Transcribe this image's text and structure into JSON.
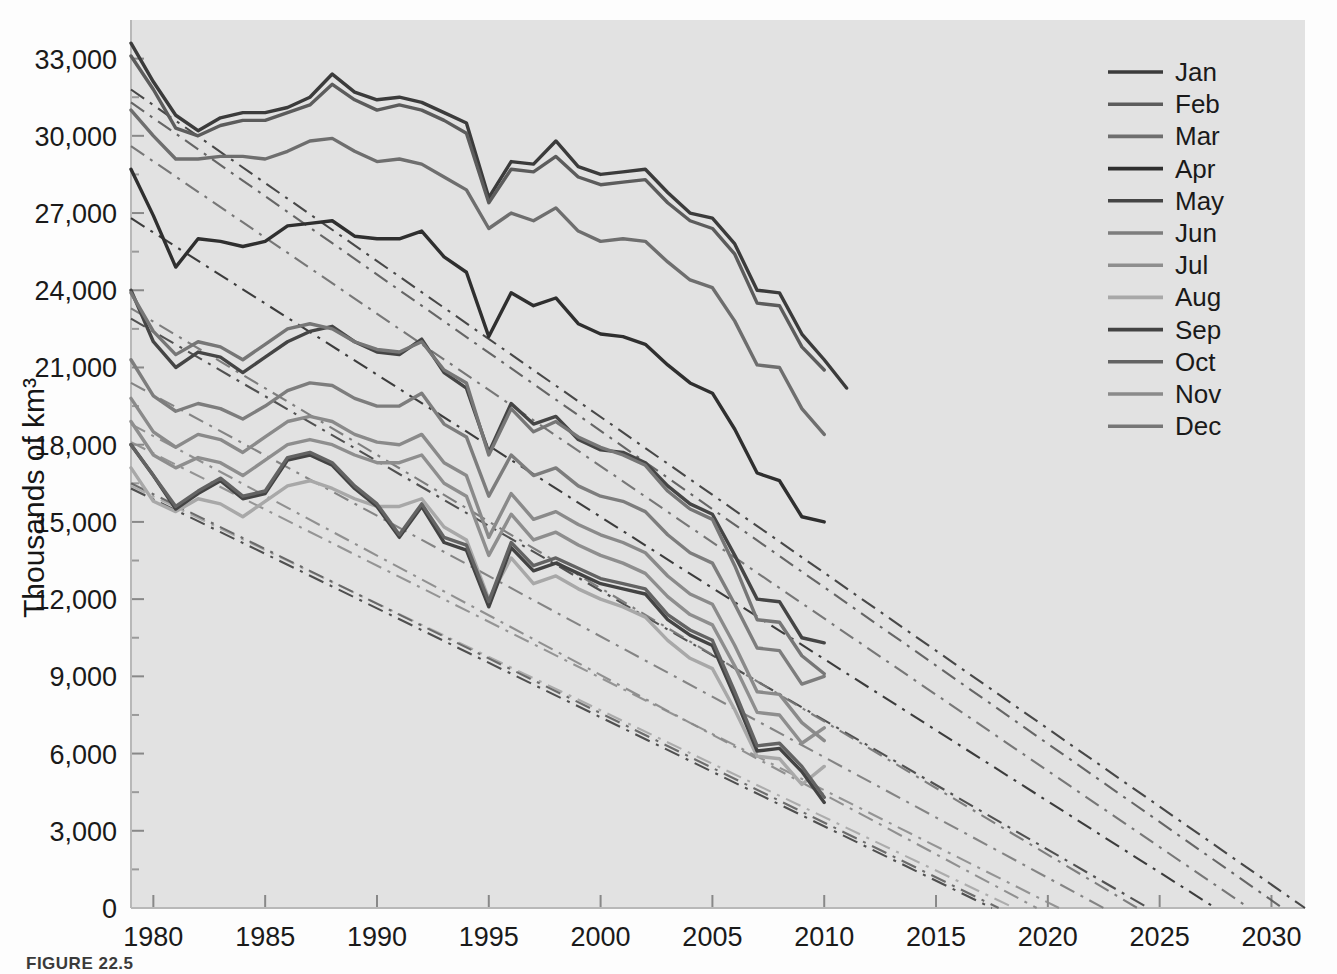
{
  "figure": {
    "caption": "FIGURE 22.5",
    "background": "#fdfdfd",
    "plot_background": "#e2e2e2"
  },
  "axis": {
    "y_title": "Thousands of km³",
    "y_ticks": [
      "0",
      "3,000",
      "6,000",
      "9,000",
      "12,000",
      "15,000",
      "18,000",
      "21,000",
      "24,000",
      "27,000",
      "30,000",
      "33,000"
    ],
    "x_ticks": [
      "1980",
      "1985",
      "1990",
      "1995",
      "2000",
      "2005",
      "2010",
      "2015",
      "2020",
      "2025",
      "2030"
    ]
  },
  "legend": {
    "items": [
      {
        "label": "Jan",
        "color": "#3b3b3b"
      },
      {
        "label": "Feb",
        "color": "#5c5c5c"
      },
      {
        "label": "Mar",
        "color": "#6e6e6e"
      },
      {
        "label": "Apr",
        "color": "#2f2f2f"
      },
      {
        "label": "May",
        "color": "#454545"
      },
      {
        "label": "Jun",
        "color": "#7d7d7d"
      },
      {
        "label": "Jul",
        "color": "#8e8e8e"
      },
      {
        "label": "Aug",
        "color": "#a8a8a8"
      },
      {
        "label": "Sep",
        "color": "#434343"
      },
      {
        "label": "Oct",
        "color": "#636363"
      },
      {
        "label": "Nov",
        "color": "#8a8a8a"
      },
      {
        "label": "Dec",
        "color": "#767676"
      }
    ]
  },
  "chart_data": {
    "type": "line",
    "title": "",
    "xlabel": "",
    "ylabel": "Thousands of km³",
    "xlim": [
      1979,
      2031.5
    ],
    "ylim": [
      0,
      34500
    ],
    "grid": false,
    "legend_position": "top-right",
    "x": [
      1979,
      1980,
      1981,
      1982,
      1983,
      1984,
      1985,
      1986,
      1987,
      1988,
      1989,
      1990,
      1991,
      1992,
      1993,
      1994,
      1995,
      1996,
      1997,
      1998,
      1999,
      2000,
      2001,
      2002,
      2003,
      2004,
      2005,
      2006,
      2007,
      2008,
      2009,
      2010,
      2011
    ],
    "series": [
      {
        "name": "Jan",
        "color": "#3b3b3b",
        "values": [
          33600,
          32100,
          30800,
          30200,
          30700,
          30900,
          30900,
          31100,
          31500,
          32400,
          31700,
          31400,
          31500,
          31300,
          30900,
          30500,
          27600,
          29000,
          28900,
          29800,
          28800,
          28500,
          28600,
          28700,
          27800,
          27000,
          26800,
          25800,
          24000,
          23900,
          22300,
          21300,
          20200
        ],
        "trend": {
          "start_year": 1979,
          "start_value": 31800,
          "end_year": 2031.5,
          "end_value": 0,
          "style": "dashdot"
        }
      },
      {
        "name": "Feb",
        "color": "#5c5c5c",
        "values": [
          33100,
          31800,
          30300,
          30000,
          30400,
          30600,
          30600,
          30900,
          31200,
          32000,
          31400,
          31000,
          31200,
          31000,
          30600,
          30100,
          27400,
          28700,
          28600,
          29200,
          28400,
          28100,
          28200,
          28300,
          27400,
          26700,
          26400,
          25400,
          23500,
          23400,
          21800,
          20900,
          null
        ],
        "trend": {
          "start_year": 1979,
          "start_value": 31300,
          "end_year": 2030.5,
          "end_value": 0,
          "style": "dashdot"
        }
      },
      {
        "name": "Mar",
        "color": "#6e6e6e",
        "values": [
          31000,
          30000,
          29100,
          29100,
          29200,
          29200,
          29100,
          29400,
          29800,
          29900,
          29400,
          29000,
          29100,
          28900,
          28400,
          27900,
          26400,
          27000,
          26700,
          27200,
          26300,
          25900,
          26000,
          25900,
          25100,
          24400,
          24100,
          22800,
          21100,
          21000,
          19400,
          18400,
          null
        ],
        "trend": {
          "start_year": 1979,
          "start_value": 29600,
          "end_year": 2029.0,
          "end_value": 0,
          "style": "dashdot"
        }
      },
      {
        "name": "Apr",
        "color": "#2f2f2f",
        "values": [
          28700,
          26900,
          24900,
          26000,
          25900,
          25700,
          25900,
          26500,
          26600,
          26700,
          26100,
          26000,
          26000,
          26300,
          25300,
          24700,
          22200,
          23900,
          23400,
          23700,
          22700,
          22300,
          22200,
          21900,
          21100,
          20400,
          20000,
          18600,
          16900,
          16600,
          15200,
          15000,
          null
        ],
        "trend": {
          "start_year": 1979,
          "start_value": 26800,
          "end_year": 2027.5,
          "end_value": 0,
          "style": "dashdot"
        }
      },
      {
        "name": "May",
        "color": "#454545",
        "values": [
          24000,
          22000,
          21000,
          21600,
          21400,
          20800,
          21400,
          22000,
          22400,
          22600,
          22000,
          21600,
          21500,
          22100,
          20800,
          20200,
          17700,
          19600,
          18800,
          19100,
          18200,
          17800,
          17700,
          17300,
          16400,
          15700,
          15300,
          13700,
          12000,
          11900,
          10500,
          10300,
          null
        ],
        "trend": {
          "start_year": 1979,
          "start_value": 22900,
          "end_year": 2024.5,
          "end_value": 0,
          "style": "dashdot"
        }
      },
      {
        "name": "Jun",
        "color": "#7d7d7d",
        "values": [
          21300,
          19900,
          19300,
          19600,
          19400,
          19000,
          19500,
          20100,
          20400,
          20300,
          19800,
          19500,
          19500,
          20000,
          18800,
          18300,
          16000,
          17600,
          16800,
          17100,
          16400,
          16000,
          15800,
          15400,
          14500,
          13800,
          13400,
          11800,
          10100,
          10000,
          8700,
          9000,
          null
        ],
        "trend": {
          "start_year": 1979,
          "start_value": 20400,
          "end_year": 2022.5,
          "end_value": 0,
          "style": "dashdot"
        }
      },
      {
        "name": "Jul",
        "color": "#8e8e8e",
        "values": [
          18900,
          17600,
          17100,
          17500,
          17300,
          16800,
          17400,
          18000,
          18200,
          18000,
          17600,
          17300,
          17300,
          17600,
          16500,
          16000,
          13700,
          15300,
          14300,
          14600,
          14100,
          13700,
          13400,
          13000,
          12100,
          11400,
          11000,
          9400,
          7600,
          7500,
          6400,
          7000,
          null
        ],
        "trend": {
          "start_year": 1979,
          "start_value": 18100,
          "end_year": 2020.5,
          "end_value": 0,
          "style": "dashdot"
        }
      },
      {
        "name": "Aug",
        "color": "#a8a8a8",
        "values": [
          17100,
          15800,
          15400,
          15900,
          15700,
          15200,
          15800,
          16400,
          16600,
          16300,
          15900,
          15600,
          15600,
          15900,
          14800,
          14300,
          12000,
          13600,
          12600,
          12900,
          12400,
          12000,
          11700,
          11300,
          10400,
          9700,
          9300,
          7700,
          5900,
          5800,
          4800,
          5500,
          null
        ],
        "trend": {
          "start_year": 1979,
          "start_value": 16400,
          "end_year": 2018.5,
          "end_value": 0,
          "style": "dashdot"
        }
      },
      {
        "name": "Sep",
        "color": "#434343",
        "values": [
          18000,
          16800,
          15500,
          16100,
          16600,
          15900,
          16100,
          17400,
          17600,
          17200,
          16300,
          15600,
          14400,
          15600,
          14200,
          13900,
          11700,
          14000,
          13100,
          13400,
          13000,
          12600,
          12400,
          12200,
          11200,
          10600,
          10200,
          8200,
          6100,
          6200,
          5300,
          4100,
          null
        ],
        "trend": {
          "start_year": 1979,
          "start_value": 16300,
          "end_year": 2017.5,
          "end_value": 0,
          "style": "dashdot"
        }
      },
      {
        "name": "Oct",
        "color": "#636363",
        "values": [
          18000,
          16800,
          15600,
          16200,
          16700,
          16000,
          16200,
          17500,
          17700,
          17300,
          16400,
          15700,
          14500,
          15700,
          14400,
          14100,
          11900,
          14200,
          13300,
          13600,
          13200,
          12800,
          12600,
          12400,
          11400,
          10800,
          10400,
          8400,
          6300,
          6400,
          5500,
          4300,
          null
        ],
        "trend": {
          "start_year": 1979,
          "start_value": 16500,
          "end_year": 2017.8,
          "end_value": 0,
          "style": "dashdot"
        }
      },
      {
        "name": "Nov",
        "color": "#8a8a8a",
        "values": [
          19800,
          18500,
          17900,
          18400,
          18200,
          17700,
          18300,
          18900,
          19100,
          18900,
          18400,
          18100,
          18000,
          18400,
          17300,
          16800,
          14400,
          16100,
          15100,
          15400,
          14900,
          14500,
          14200,
          13800,
          12900,
          12200,
          11800,
          10200,
          8400,
          8300,
          7200,
          6500,
          null
        ],
        "trend": {
          "start_year": 1979,
          "start_value": 18800,
          "end_year": 2019.5,
          "end_value": 0,
          "style": "dashdot"
        }
      },
      {
        "name": "Dec",
        "color": "#767676",
        "values": [
          23900,
          22400,
          21500,
          22000,
          21800,
          21300,
          21900,
          22500,
          22700,
          22500,
          22000,
          21700,
          21600,
          22000,
          20900,
          20400,
          17600,
          19400,
          18500,
          18900,
          18300,
          17900,
          17600,
          17200,
          16200,
          15500,
          15100,
          13300,
          11200,
          11100,
          9800,
          9100,
          null
        ],
        "trend": {
          "start_year": 1979,
          "start_value": 23300,
          "end_year": 2024.0,
          "end_value": 0,
          "style": "dashdot"
        }
      }
    ]
  }
}
